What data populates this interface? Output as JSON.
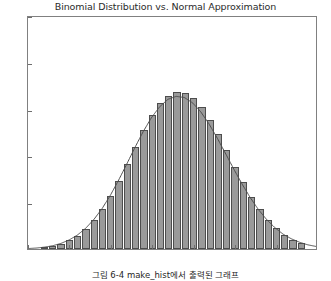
{
  "chart_data": {
    "type": "bar",
    "title": "Binomial Distribution vs. Normal Approximation",
    "xlabel": "",
    "ylabel": "",
    "xlim": [
      55,
      90
    ],
    "ylim": [
      0.0,
      0.1
    ],
    "grid": false,
    "legend": null,
    "xticks": [
      55,
      60,
      65,
      70,
      75,
      80,
      85,
      90
    ],
    "xtick_labels": [
      "55",
      "60",
      "65",
      "70",
      "75",
      "80",
      "85",
      "90"
    ],
    "yticks": [
      0.0,
      0.02,
      0.04,
      0.06,
      0.08,
      0.1
    ],
    "ytick_labels": [
      "0.00",
      "0.02",
      "0.04",
      "0.06",
      "0.08",
      "0.10"
    ],
    "series": [
      {
        "name": "Binomial histogram",
        "type": "bar",
        "fill_color": "#9a9a9a",
        "edge_color": "#4d4d4d",
        "bar_width": 0.88,
        "x": [
          57,
          58,
          59,
          60,
          61,
          62,
          63,
          64,
          65,
          66,
          67,
          68,
          69,
          70,
          71,
          72,
          73,
          74,
          75,
          76,
          77,
          78,
          79,
          80,
          81,
          82,
          83,
          84,
          85,
          86,
          87,
          88
        ],
        "values": [
          0.0008,
          0.0014,
          0.0023,
          0.0037,
          0.0057,
          0.0085,
          0.0122,
          0.0169,
          0.0226,
          0.0292,
          0.0363,
          0.0437,
          0.0508,
          0.0571,
          0.0622,
          0.0656,
          0.0672,
          0.0668,
          0.0646,
          0.0606,
          0.0553,
          0.049,
          0.0422,
          0.0352,
          0.0285,
          0.0223,
          0.0169,
          0.0124,
          0.0088,
          0.006,
          0.004,
          0.0025
        ]
      },
      {
        "name": "Normal approximation",
        "type": "line",
        "line_color": "#4d4d4d",
        "line_width": 1,
        "x": [
          55,
          56,
          57,
          58,
          59,
          60,
          61,
          62,
          63,
          64,
          65,
          66,
          67,
          68,
          69,
          70,
          71,
          72,
          73,
          74,
          75,
          76,
          77,
          78,
          79,
          80,
          81,
          82,
          83,
          84,
          85,
          86,
          87,
          88,
          89,
          90
        ],
        "values": [
          0.0002,
          0.0004,
          0.0008,
          0.0014,
          0.0024,
          0.0039,
          0.006,
          0.0089,
          0.0127,
          0.0174,
          0.0231,
          0.0296,
          0.0366,
          0.0438,
          0.0506,
          0.0566,
          0.0613,
          0.0645,
          0.0658,
          0.0653,
          0.063,
          0.0591,
          0.0539,
          0.0478,
          0.0412,
          0.0345,
          0.0281,
          0.0222,
          0.017,
          0.0127,
          0.0092,
          0.0064,
          0.0044,
          0.0029,
          0.0018,
          0.0011
        ]
      }
    ]
  },
  "figure": {
    "caption": "그림 6-4 make_hist에서 출력된 그래프"
  }
}
